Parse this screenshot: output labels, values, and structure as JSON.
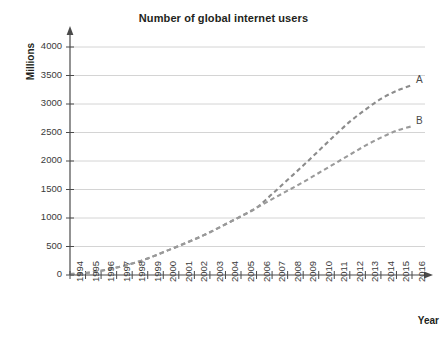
{
  "chart_data": {
    "type": "line",
    "title": "Number of global internet users",
    "xlabel": "Year",
    "ylabel": "Millions",
    "grid": true,
    "legend_position": "inline-end-labels",
    "xlim": [
      1994,
      2016
    ],
    "ylim": [
      0,
      4000
    ],
    "ytick_labels": [
      "0",
      "500",
      "1000",
      "1500",
      "2000",
      "2500",
      "3000",
      "3500",
      "4000"
    ],
    "ytick_values": [
      0,
      500,
      1000,
      1500,
      2000,
      2500,
      3000,
      3500,
      4000
    ],
    "categories": [
      "1994",
      "1995",
      "1996",
      "1997",
      "1998",
      "1999",
      "2000",
      "2001",
      "2002",
      "2003",
      "2004",
      "2005",
      "2006",
      "2007",
      "2008",
      "2009",
      "2010",
      "2011",
      "2012",
      "2013",
      "2014",
      "2015",
      "2016"
    ],
    "x": [
      1994,
      1995,
      1996,
      1997,
      1998,
      1999,
      2000,
      2001,
      2002,
      2003,
      2004,
      2005,
      2006,
      2007,
      2008,
      2009,
      2010,
      2011,
      2012,
      2013,
      2014,
      2015,
      2016
    ],
    "series": [
      {
        "name": "A",
        "label": "A",
        "style": "dashed",
        "color": "#8c8c8c",
        "values": [
          15,
          35,
          75,
          130,
          200,
          290,
          400,
          510,
          625,
          750,
          890,
          1030,
          1180,
          1420,
          1670,
          1920,
          2180,
          2440,
          2690,
          2900,
          3090,
          3230,
          3330
        ]
      },
      {
        "name": "B",
        "label": "B",
        "style": "dashed",
        "color": "#9a9a9a",
        "values": [
          15,
          35,
          75,
          130,
          200,
          290,
          400,
          510,
          625,
          750,
          890,
          1030,
          1180,
          1330,
          1480,
          1630,
          1790,
          1950,
          2110,
          2270,
          2410,
          2530,
          2610
        ]
      }
    ],
    "annotations": [
      {
        "text": "A",
        "x": 2016,
        "y": 3400
      },
      {
        "text": "B",
        "x": 2016,
        "y": 2680
      }
    ],
    "colors": {
      "axis": "#4a4a4a",
      "grid": "#d4d4d4",
      "curve": "#8c8c8c",
      "text": "#231f20"
    }
  }
}
